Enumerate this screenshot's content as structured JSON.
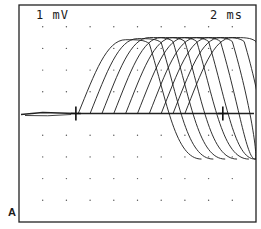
{
  "figure": {
    "panel_label": "A",
    "voltage_scale": "1 mV",
    "time_scale": "2 ms"
  },
  "chart_data": {
    "type": "line",
    "title": "",
    "panel": "A",
    "annotations": [
      "1 mV",
      "2 ms"
    ],
    "xlabel": "time",
    "ylabel": "voltage",
    "scale_bars": {
      "vertical": "1 mV per division",
      "horizontal": "2 ms per division"
    },
    "grid": "dotted, 10 x 10 divisions",
    "x_divisions": 10,
    "y_divisions": 10,
    "baseline_division_from_top": 5,
    "markers": [
      {
        "type": "cross",
        "x_div": 2.4,
        "y_div": 5.0
      },
      {
        "type": "cross",
        "x_div": 8.6,
        "y_div": 5.0
      }
    ],
    "series_description": "Superimposed family of traces with progressively increasing latency; each trace rises from baseline to a peak about 3.5 divisions (~3.5 mV) above baseline, plateaus, then descends and undershoots about 2 divisions below baseline toward the right side.",
    "series": [
      {
        "name": "trace 1",
        "onset_div": 2.5,
        "peak_div": 1.6,
        "undershoot_div": 7.1
      },
      {
        "name": "trace 2",
        "onset_div": 3.0,
        "peak_div": 1.55,
        "undershoot_div": 7.1
      },
      {
        "name": "trace 3",
        "onset_div": 3.5,
        "peak_div": 1.5,
        "undershoot_div": 7.1
      },
      {
        "name": "trace 4",
        "onset_div": 4.0,
        "peak_div": 1.5,
        "undershoot_div": 7.1
      },
      {
        "name": "trace 5",
        "onset_div": 4.5,
        "peak_div": 1.5,
        "undershoot_div": 7.1
      },
      {
        "name": "trace 6",
        "onset_div": 5.0,
        "peak_div": 1.5,
        "undershoot_div": 7.1
      },
      {
        "name": "trace 7",
        "onset_div": 5.5,
        "peak_div": 1.5,
        "undershoot_div": 7.1
      },
      {
        "name": "trace 8",
        "onset_div": 6.0,
        "peak_div": 1.5,
        "undershoot_div": 7.1
      },
      {
        "name": "trace 9",
        "onset_div": 6.5,
        "peak_div": 1.5,
        "undershoot_div": 7.1
      },
      {
        "name": "trace 10",
        "onset_div": 7.0,
        "peak_div": 1.5,
        "undershoot_div": 7.1
      }
    ]
  }
}
